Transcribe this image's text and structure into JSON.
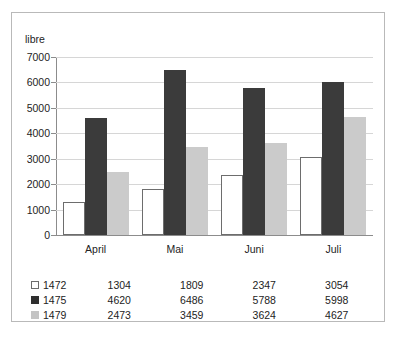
{
  "chart_data": {
    "type": "bar",
    "title": "",
    "subtitle": "",
    "xlabel": "",
    "ylabel": "libre",
    "categories": [
      "April",
      "Mai",
      "Juni",
      "Juli"
    ],
    "series": [
      {
        "name": "1472",
        "values": [
          1304,
          1809,
          2347,
          3054
        ],
        "color": "#ffffff",
        "marker": "open-square"
      },
      {
        "name": "1475",
        "values": [
          4620,
          6486,
          5788,
          5998
        ],
        "color": "#3b3b3b",
        "marker": "filled-square"
      },
      {
        "name": "1479",
        "values": [
          2473,
          3459,
          3624,
          4627
        ],
        "color": "#cbcbcb",
        "marker": "gray-square"
      }
    ],
    "ylim": [
      0,
      7000
    ],
    "yticks": [
      0,
      1000,
      2000,
      3000,
      4000,
      5000,
      6000,
      7000
    ],
    "ytick_labels": [
      "0",
      "1000",
      "2000",
      "3000",
      "4000",
      "5000",
      "6000",
      "7000"
    ],
    "grid": true,
    "legend_position": "bottom-table",
    "has_data_table": true
  },
  "colors": {
    "frame_border": "#b9b9b9",
    "gridline": "#d6d6d6",
    "axis_line": "#8c8c8c",
    "text": "#232323"
  }
}
